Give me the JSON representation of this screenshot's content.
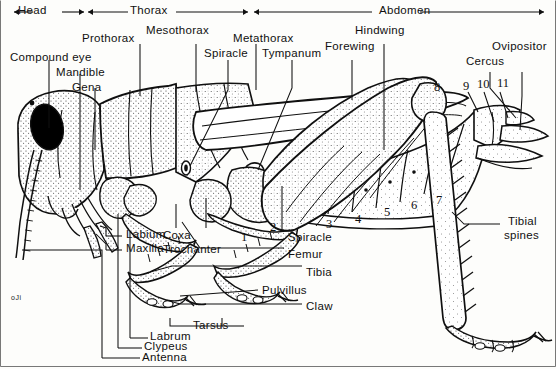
{
  "figure": {
    "signature": "oJi",
    "ink_color": "#101010",
    "stipple_color": "#2b2b2b",
    "background_color": "#fdfdfb",
    "eye_color": "#000000"
  },
  "region_brackets": [
    {
      "label": "Head",
      "x": 10,
      "y": 4,
      "w": 80,
      "arrows": "both"
    },
    {
      "label": "Thorax",
      "x": 92,
      "y": 4,
      "w": 160,
      "arrows": "both"
    },
    {
      "label": "Abdomen",
      "x": 256,
      "y": 4,
      "w": 290,
      "arrows": "both"
    }
  ],
  "labels": {
    "compound_eye": "Compound eye",
    "mandible": "Mandible",
    "gena": "Gena",
    "prothorax": "Prothorax",
    "mesothorax": "Mesothorax",
    "metathorax": "Metathorax",
    "spiracle_thorax": "Spiracle",
    "tympanum": "Tympanum",
    "forewing": "Forewing",
    "hindwing": "Hindwing",
    "ovipositor": "Ovipositor",
    "cercus": "Cercus",
    "labium": "Labium",
    "maxilla": "Maxilla",
    "coxa": "Coxa",
    "trochanter": "Trochanter",
    "spiracle_abdomen": "Spiracle",
    "femur": "Femur",
    "tibia": "Tibia",
    "pulvillus": "Pulvillus",
    "claw": "Claw",
    "tarsus": "Tarsus",
    "labrum": "Labrum",
    "clypeus": "Clypeus",
    "antenna": "Antenna",
    "tibial_spines_line1": "Tibial",
    "tibial_spines_line2": "spines"
  },
  "segment_numbers": {
    "abdominal": [
      "1",
      "2",
      "3",
      "4",
      "5",
      "6",
      "7",
      "8",
      "9",
      "10",
      "11"
    ]
  }
}
